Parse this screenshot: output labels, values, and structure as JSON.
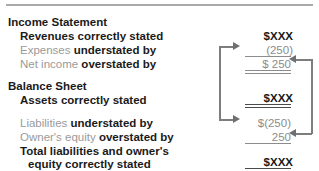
{
  "figure": {
    "title_divider": true,
    "sections": [
      {
        "heading": "Income Statement",
        "lines": [
          {
            "label_muted": "",
            "label_bold": "Revenues correctly stated",
            "amount": "$XXX"
          },
          {
            "label_muted": "Expenses",
            "label_bold": "understated by",
            "amount": "(250)"
          },
          {
            "label_muted": "Net income",
            "label_bold": "overstated by",
            "amount": "$ 250"
          }
        ]
      },
      {
        "heading": "Balance Sheet",
        "lines": [
          {
            "label_muted": "",
            "label_bold": "Assets correctly stated",
            "amount": "$XXX"
          },
          {
            "label_muted": "Liabilities",
            "label_bold": "understated by",
            "amount": "$(250)"
          },
          {
            "label_muted": "Owner's equity",
            "label_bold": "overstated by",
            "amount": "250"
          },
          {
            "label_muted": "",
            "label_bold": "Total liabilities and owner's",
            "amount": ""
          },
          {
            "label_muted": "",
            "label_bold": "equity correctly stated",
            "amount": "$XXX"
          }
        ]
      }
    ]
  },
  "text": {
    "income_statement_heading": "Income Statement",
    "revenues_line": "Revenues correctly stated",
    "expenses_muted": "Expenses",
    "expenses_bold": "understated by",
    "net_income_muted": "Net income",
    "net_income_bold": "overstated by",
    "balance_sheet_heading": "Balance Sheet",
    "assets_line": "Assets correctly stated",
    "liabilities_muted": "Liabilities",
    "liabilities_bold": "understated by",
    "owners_equity_muted": "Owner's equity",
    "owners_equity_bold": "overstated by",
    "total_line_1": "Total liabilities and owner's",
    "total_line_2": "equity correctly stated"
  },
  "amounts": {
    "revenues": "$XXX",
    "expenses": "(250)",
    "net_income": "$ 250",
    "assets": "$XXX",
    "liabilities": "$(250)",
    "owners_equity": "250",
    "total_liabilities_equity": "$XXX"
  },
  "colors": {
    "text_dark": "#1a1a1a",
    "text_muted": "#9a9a9a",
    "amount_muted": "#8c8c8c",
    "connector": "#7d7d7d",
    "rule": "#a9a9a9",
    "background": "#ffffff"
  },
  "connectors": {
    "left_bracket_label": "net-income-to-liabilities-connector",
    "right_bracket_label": "expenses-to-owners-equity-connector"
  }
}
